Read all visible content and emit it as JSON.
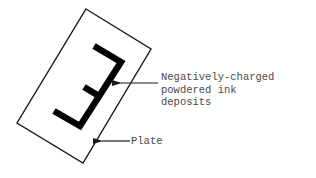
{
  "diagram": {
    "plate": {
      "label": "Plate",
      "corners": [
        [
          86,
          9
        ],
        [
          151,
          49
        ],
        [
          83,
          163
        ],
        [
          17,
          123
        ]
      ]
    },
    "glyph": {
      "letter": "E (mirrored, rotated)",
      "color": "#000000"
    },
    "callouts": [
      {
        "id": "ink",
        "lines": [
          "Negatively-charged",
          "powdered ink",
          "deposits"
        ],
        "arrow_tip": [
          120,
          83
        ],
        "arrow_tail": [
          158,
          83
        ]
      },
      {
        "id": "plate",
        "lines": [
          "Plate"
        ],
        "arrow_tip": [
          101,
          141
        ],
        "arrow_tail": [
          130,
          141
        ]
      }
    ],
    "colors": {
      "line": "#1a1a1a",
      "text": "#4a4a4a",
      "background": "#ffffff"
    }
  }
}
